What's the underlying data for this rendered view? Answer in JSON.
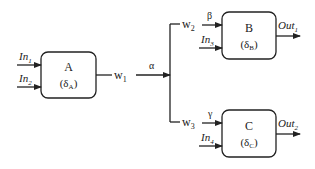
{
  "diagram": {
    "blocks": [
      {
        "id": "A",
        "name": "A",
        "delta": "(δ",
        "sub": "A",
        "close": ")"
      },
      {
        "id": "B",
        "name": "B",
        "delta": "(δ",
        "sub": "B",
        "close": ")"
      },
      {
        "id": "C",
        "name": "C",
        "delta": "(δ",
        "sub": "C",
        "close": ")"
      }
    ],
    "inputs": {
      "in1": {
        "base": "In",
        "sub": "1"
      },
      "in2": {
        "base": "In",
        "sub": "2"
      },
      "in3": {
        "base": "In",
        "sub": "3"
      },
      "in4": {
        "base": "In",
        "sub": "4"
      }
    },
    "outputs": {
      "out1": {
        "base": "Out",
        "sub": "1"
      },
      "out2": {
        "base": "Out",
        "sub": "2"
      }
    },
    "wires": {
      "w1": {
        "base": "w",
        "sub": "1"
      },
      "w2": {
        "base": "w",
        "sub": "2"
      },
      "w3": {
        "base": "w",
        "sub": "3"
      }
    },
    "greek": {
      "alpha": "α",
      "beta": "β",
      "gamma": "γ"
    }
  }
}
